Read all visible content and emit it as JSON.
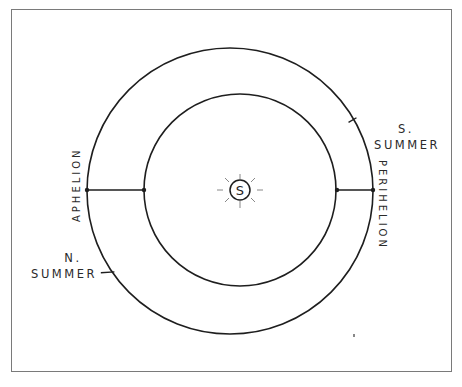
{
  "diagram": {
    "type": "orbit-diagram",
    "sun_label": "S",
    "labels": {
      "aphelion": "APHELION",
      "perihelion": "PERIHELION",
      "n_summer_line1": "N.",
      "n_summer_line2": "SUMMER",
      "s_summer_line1": "S.",
      "s_summer_line2": "SUMMER"
    },
    "colors": {
      "stroke": "#1e1e1e",
      "frame": "#6a6a6a",
      "background": "#ffffff"
    }
  }
}
